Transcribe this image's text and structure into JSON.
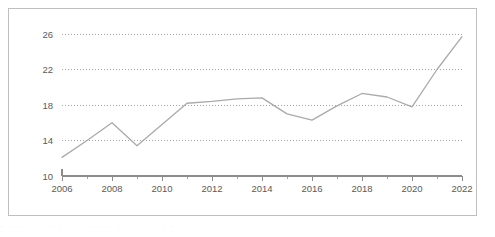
{
  "chart_data": {
    "type": "line",
    "title": "",
    "subtitle": "",
    "xlabel": "",
    "ylabel": "",
    "x": [
      2006,
      2007,
      2008,
      2009,
      2010,
      2011,
      2012,
      2013,
      2014,
      2015,
      2016,
      2017,
      2018,
      2019,
      2020,
      2021,
      2022
    ],
    "values": [
      12.1,
      14.0,
      16.0,
      13.4,
      15.8,
      18.2,
      18.4,
      18.7,
      18.8,
      17.0,
      16.3,
      17.9,
      19.3,
      18.9,
      17.8,
      22.0,
      25.7
    ],
    "series": [
      {
        "name": "series-1",
        "values": [
          12.1,
          14.0,
          16.0,
          13.4,
          15.8,
          18.2,
          18.4,
          18.7,
          18.8,
          17.0,
          16.3,
          17.9,
          19.3,
          18.9,
          17.8,
          22.0,
          25.7
        ]
      }
    ],
    "xlim": [
      2006,
      2022
    ],
    "ylim": [
      10,
      26
    ],
    "y_ticks": [
      10,
      14,
      18,
      22,
      26
    ],
    "y_tick_labels": [
      "10",
      "14",
      "18",
      "22",
      "26"
    ],
    "x_ticks": [
      2006,
      2008,
      2010,
      2012,
      2014,
      2016,
      2018,
      2020,
      2022
    ],
    "x_tick_labels": [
      "2006",
      "2008",
      "2010",
      "2012",
      "2014",
      "2016",
      "2018",
      "2020",
      "2022"
    ],
    "x_minor_ticks": [
      2007,
      2009,
      2011,
      2013,
      2015,
      2017,
      2019,
      2021
    ],
    "grid": true,
    "grid_axis": "y",
    "grid_style": "dotted",
    "legend": false,
    "legend_position": "none",
    "colors": {
      "line": "#aaaaaa",
      "grid": "#9a9a9a",
      "axis": "#8c8c8c",
      "tick_text": "#5a5a5a",
      "frame": "#bfbfbf",
      "background": "#ffffff"
    }
  },
  "footer": {
    "artifact_text": "· · ·· · · ··· · ·· ····· · ·· · ·· · ·"
  }
}
